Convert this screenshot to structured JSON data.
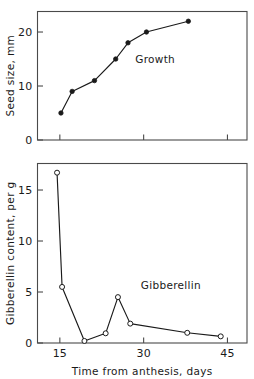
{
  "figure": {
    "background": "#ffffff",
    "ink_color": "#1a1a1a",
    "frame_color": "#4a4a4a"
  },
  "chart_data": [
    {
      "id": "growth-panel",
      "type": "line",
      "title": "",
      "xlabel": "",
      "ylabel": "Seed size, mm",
      "xlim": [
        11,
        48.5
      ],
      "ylim": [
        0,
        23.8
      ],
      "xticks": [
        15,
        30,
        45
      ],
      "xticklabels": [
        "",
        "",
        ""
      ],
      "yticks": [
        0,
        10,
        20
      ],
      "yticklabels": [
        "0",
        "10",
        "20"
      ],
      "grid": false,
      "legend": "none",
      "marker": "filled-circle",
      "annotations": [
        {
          "text": "Growth",
          "x": 28.5,
          "y": 14.2
        }
      ],
      "series": [
        {
          "name": "Growth",
          "x": [
            15.2,
            17.2,
            21.2,
            25.0,
            27.2,
            30.5,
            38.0
          ],
          "values": [
            5.0,
            9.0,
            11.0,
            15.0,
            18.0,
            20.0,
            22.0
          ]
        }
      ]
    },
    {
      "id": "gibberellin-panel",
      "type": "line",
      "title": "",
      "xlabel": "Time from anthesis, days",
      "ylabel": "Gibberellin content, per g",
      "xlim": [
        11,
        48.5
      ],
      "ylim": [
        0,
        17.6
      ],
      "xticks": [
        15,
        30,
        45
      ],
      "xticklabels": [
        "15",
        "30",
        "45"
      ],
      "yticks": [
        0,
        5,
        10,
        15
      ],
      "yticklabels": [
        "0",
        "5",
        "10",
        "15"
      ],
      "grid": false,
      "legend": "none",
      "marker": "open-circle",
      "annotations": [
        {
          "text": "Gibberellin",
          "x": 29.5,
          "y": 5.3
        }
      ],
      "series": [
        {
          "name": "Gibberellin",
          "x": [
            14.5,
            15.4,
            19.4,
            23.2,
            25.4,
            27.6,
            37.8,
            43.8
          ],
          "values": [
            16.7,
            5.5,
            0.2,
            0.95,
            4.5,
            1.9,
            1.0,
            0.65
          ]
        }
      ]
    }
  ]
}
